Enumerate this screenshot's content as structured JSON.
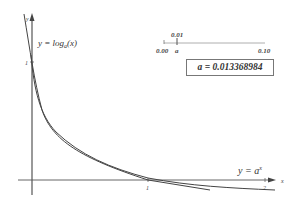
{
  "graph": {
    "log_label": "y = log a(x)",
    "log_label_main": "y = log",
    "log_label_sub": "a",
    "log_label_arg": "(x)",
    "exp_label_main": "y = a",
    "exp_label_sup": "x",
    "x_axis_label": "x",
    "y_axis_label": "y",
    "x_ticks": [
      "1",
      "2"
    ],
    "y_ticks": [
      "1"
    ],
    "colors": {
      "axis": "#555555",
      "curve": "#444444"
    }
  },
  "slider": {
    "min_label": "0.00",
    "max_label": "0.10",
    "value_label": "0.01",
    "handle_label": "a",
    "value": 0.013368984
  },
  "readout": {
    "text": "a = 0.013368984"
  }
}
